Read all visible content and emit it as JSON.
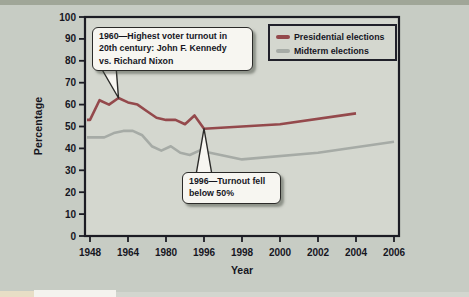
{
  "figure": {
    "background_color": "#c7ccc4",
    "top_band_color": "#a0a698",
    "plot_background_color": "#d4d7cf",
    "axis_color": "#1c1c24",
    "text_color": "#16161f",
    "callout_background": "#f7f6f1"
  },
  "chart_data": {
    "type": "line",
    "title": "",
    "xlabel": "Year",
    "ylabel": "Percentage",
    "x_ticks": [
      1948,
      1964,
      1980,
      1996,
      1998,
      2000,
      2002,
      2004,
      2006
    ],
    "y_ticks": [
      0,
      10,
      20,
      30,
      40,
      50,
      60,
      70,
      80,
      90,
      100
    ],
    "ylim": [
      0,
      100
    ],
    "grid": false,
    "legend_position": "top-right",
    "series": [
      {
        "name": "Presidential elections",
        "color": "#94494c",
        "x": [
          1948,
          1952,
          1956,
          1960,
          1964,
          1968,
          1972,
          1976,
          1980,
          1984,
          1988,
          1992,
          1996,
          2000,
          2004
        ],
        "values": [
          53,
          62,
          60,
          63,
          61,
          60,
          57,
          54,
          53,
          53,
          51,
          55,
          49,
          51,
          56
        ]
      },
      {
        "name": "Midterm elections",
        "color": "#a6aba6",
        "x": [
          1950,
          1954,
          1958,
          1962,
          1966,
          1970,
          1974,
          1978,
          1982,
          1986,
          1990,
          1994,
          1998,
          2002,
          2006
        ],
        "values": [
          45,
          45,
          47,
          48,
          48,
          46,
          41,
          39,
          41,
          38,
          37,
          39,
          35,
          38,
          43
        ]
      }
    ],
    "annotations": [
      {
        "text": "1960—Highest voter turnout in\n20th century: John F. Kennedy\nvs. Richard Nixon",
        "target_year": 1960,
        "target_value": 63
      },
      {
        "text": "1996—Turnout fell\nbelow 50%",
        "target_year": 1996,
        "target_value": 49
      }
    ]
  }
}
